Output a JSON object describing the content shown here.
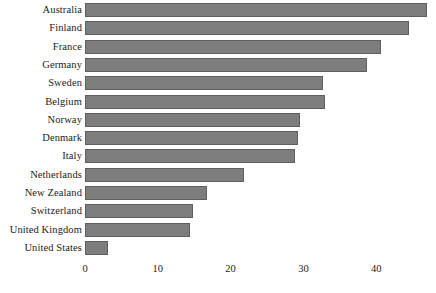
{
  "chart_data": {
    "type": "bar",
    "orientation": "horizontal",
    "title": "",
    "subtitle": "",
    "xlabel": "",
    "ylabel": "",
    "xlim": [
      0,
      48
    ],
    "ylim": null,
    "grid": false,
    "legend": null,
    "xticks": [
      0,
      10,
      20,
      30,
      40
    ],
    "xtick_labels": [
      "0",
      "10",
      "20",
      "30",
      "40"
    ],
    "categories": [
      "Australia",
      "Finland",
      "France",
      "Germany",
      "Sweden",
      "Belgium",
      "Norway",
      "Denmark",
      "Italy",
      "Netherlands",
      "New Zealand",
      "Switzerland",
      "United Kingdom",
      "United States"
    ],
    "values": [
      47,
      44.5,
      40.7,
      38.8,
      32.7,
      32.9,
      29.5,
      29.3,
      28.9,
      21.8,
      16.7,
      14.8,
      14.4,
      3.2
    ],
    "bar_color": "#7d7d7d",
    "bar_border_color": "#5f5f5f",
    "background_color": "#ffffff",
    "text_color": "#1b1b1b"
  }
}
